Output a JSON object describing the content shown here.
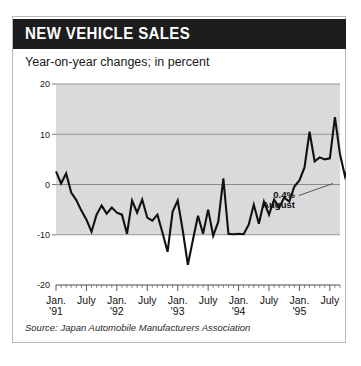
{
  "card": {
    "title": "NEW VEHICLE SALES",
    "subtitle": "Year-on-year changes; in percent",
    "source": "Source: Japan Automobile Manufacturers Association",
    "header_bg": "#1d1d1d",
    "header_fg": "#ffffff",
    "plot_band_color": "#d4d4d4",
    "line_color": "#111111"
  },
  "annotation": {
    "value": "0.4%",
    "label": "August"
  },
  "chart_data": {
    "type": "line",
    "title": "NEW VEHICLE SALES",
    "subtitle": "Year-on-year changes; in percent",
    "xlabel": "",
    "ylabel": "percent",
    "ylim": [
      -20,
      20
    ],
    "yticks": [
      20,
      10,
      0,
      -10,
      -20
    ],
    "ytick_labels": [
      "20",
      "10",
      "0",
      "-10",
      "-20"
    ],
    "grid": true,
    "gridlines_at": [
      20,
      10,
      0,
      -10
    ],
    "legend": "none",
    "x_major_ticks": [
      {
        "label_top": "Jan.",
        "label_bottom": "'91",
        "index": 0
      },
      {
        "label_top": "July",
        "label_bottom": "",
        "index": 6
      },
      {
        "label_top": "Jan.",
        "label_bottom": "'92",
        "index": 12
      },
      {
        "label_top": "July",
        "label_bottom": "",
        "index": 18
      },
      {
        "label_top": "Jan.",
        "label_bottom": "'93",
        "index": 24
      },
      {
        "label_top": "July",
        "label_bottom": "",
        "index": 30
      },
      {
        "label_top": "Jan.",
        "label_bottom": "'94",
        "index": 36
      },
      {
        "label_top": "July",
        "label_bottom": "",
        "index": 42
      },
      {
        "label_top": "Jan.",
        "label_bottom": "'95",
        "index": 48
      },
      {
        "label_top": "July",
        "label_bottom": "",
        "index": 54
      }
    ],
    "x_start": "1991-01",
    "x_end": "1995-08",
    "x_tick_interval_months": 1,
    "annotations": [
      {
        "text": "0.4%",
        "sublabel": "August",
        "x_index": 55,
        "y": 0.4
      }
    ],
    "series": [
      {
        "name": "New vehicle sales, year-on-year % change",
        "values": [
          2.6,
          0.2,
          2.2,
          -1.6,
          -3.1,
          -5.2,
          -7.0,
          -9.4,
          -6.0,
          -4.2,
          -5.8,
          -4.6,
          -5.6,
          -6.0,
          -9.8,
          -3.2,
          -5.6,
          -3.0,
          -6.6,
          -7.2,
          -6.0,
          -9.6,
          -13.4,
          -5.4,
          -3.2,
          -9.2,
          -16.0,
          -11.0,
          -6.2,
          -9.8,
          -5.0,
          -10.2,
          -7.4,
          1.2,
          -9.8,
          -9.9,
          -9.8,
          -9.9,
          -8.0,
          -4.0,
          -7.8,
          -3.4,
          -6.0,
          -3.0,
          -4.6,
          -2.6,
          -3.4,
          -0.4,
          0.8,
          3.4,
          10.5,
          4.6,
          5.4,
          5.0,
          5.2,
          13.4,
          6.0,
          1.6,
          4.4,
          2.6,
          0.4
        ]
      }
    ]
  }
}
